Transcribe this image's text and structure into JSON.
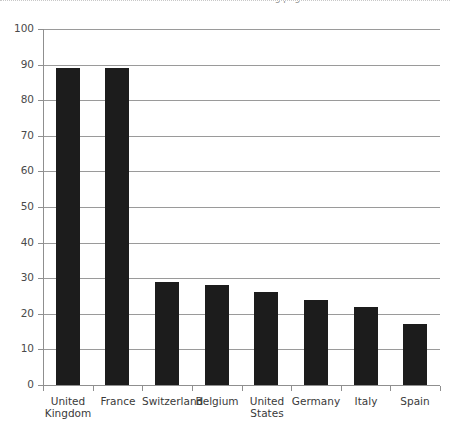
{
  "top_strip": {
    "clipped_caption": "Exhibit continued on following page"
  },
  "chart_data": {
    "type": "bar",
    "title": "",
    "subtitle": "",
    "xlabel": "",
    "ylabel": "",
    "categories": [
      "United Kingdom",
      "France",
      "Switzerland",
      "Belgium",
      "United States",
      "Germany",
      "Italy",
      "Spain"
    ],
    "category_lines": [
      [
        "United",
        "Kingdom"
      ],
      [
        "France"
      ],
      [
        "Switzerland"
      ],
      [
        "Belgium"
      ],
      [
        "United",
        "States"
      ],
      [
        "Germany"
      ],
      [
        "Italy"
      ],
      [
        "Spain"
      ]
    ],
    "values": [
      89,
      89,
      29,
      28,
      26,
      24,
      22,
      17
    ],
    "ylim": [
      0,
      100
    ],
    "ytick_step": 10,
    "ytick_labels": [
      "0",
      "10",
      "20",
      "30",
      "40",
      "50",
      "60",
      "70",
      "80",
      "90",
      "100"
    ],
    "grid": true,
    "grid_axis": "y",
    "legend": false,
    "legend_position": "none",
    "data_labels_shown": false,
    "colors": {
      "bar": "#1c1c1c",
      "gridline": "#9a9a9a",
      "axis": "#8f8f8f",
      "tick_text": "#4a4a4a",
      "category_text": "#3a3a3a",
      "background": "#ffffff"
    }
  }
}
